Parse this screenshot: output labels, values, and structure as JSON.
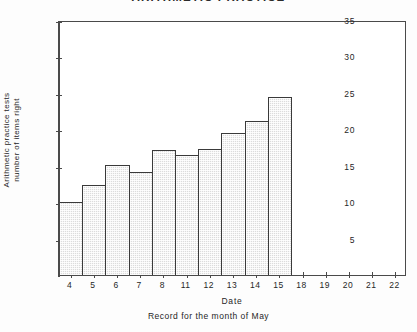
{
  "chart_data": {
    "type": "bar",
    "title": "ARITHMETIC  PRACTICE",
    "categories": [
      "4",
      "5",
      "6",
      "7",
      "8",
      "11",
      "12",
      "13",
      "14",
      "15"
    ],
    "values": [
      10.0,
      12.3,
      15.1,
      14.2,
      17.2,
      16.5,
      17.3,
      19.5,
      21.2,
      24.4
    ],
    "xlabel": "Date",
    "ylabel": "Arithmetic practice tests number of items right",
    "ylabel_lines": [
      "Arithmetic practice tests",
      "number of items right"
    ],
    "caption": "Record for the month of May",
    "xticks": [
      "4",
      "5",
      "6",
      "7",
      "8",
      "11",
      "12",
      "13",
      "14",
      "15",
      "18",
      "19",
      "20",
      "21",
      "22"
    ],
    "yticks": [
      5,
      10,
      15,
      20,
      25,
      30,
      35
    ],
    "ylim": [
      0,
      35
    ],
    "grid": false,
    "legend": false,
    "bar_fill_color": "#dcdcdc",
    "bar_border_color": "#3a3a3a",
    "axis_color": "#4a4a4a",
    "background_color": "#ffffff"
  }
}
